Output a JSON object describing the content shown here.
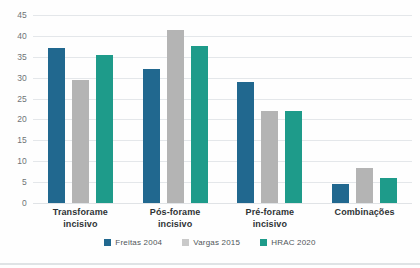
{
  "chart_data": {
    "type": "bar",
    "title": "",
    "xlabel": "",
    "ylabel": "",
    "ylim": [
      0,
      45
    ],
    "yticks": [
      45,
      40,
      35,
      30,
      25,
      20,
      15,
      10,
      5,
      0
    ],
    "grid": true,
    "legend_position": "bottom",
    "categories": [
      "Transforame incisivo",
      "Pós-forame incisivo",
      "Pré-forame incisivo",
      "Combinações"
    ],
    "category_lines": [
      [
        "Transforame",
        "incisivo"
      ],
      [
        "Pós-forame",
        "incisivo"
      ],
      [
        "Pré-forame",
        "incisivo"
      ],
      [
        "Combinações",
        ""
      ]
    ],
    "series": [
      {
        "name": "Freitas 2004",
        "color": "#21688f",
        "values": [
          37,
          32,
          29,
          4.5
        ]
      },
      {
        "name": "Vargas 2015",
        "color": "#b4b4b4",
        "values": [
          29.5,
          41.5,
          22,
          8.5
        ]
      },
      {
        "name": "HRAC 2020",
        "color": "#1e9b8a",
        "values": [
          35.5,
          37.5,
          22,
          6
        ]
      }
    ]
  },
  "colors": {
    "series_1": "#21688f",
    "series_2": "#b4b4b4",
    "series_3": "#1e9b8a",
    "gridline": "#e4e7ea",
    "axis_text": "#6f7477",
    "label_text": "#2f3335",
    "background": "#ffffff"
  }
}
